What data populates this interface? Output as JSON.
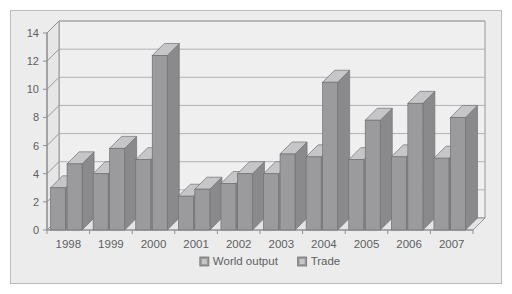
{
  "chart_data": {
    "type": "bar",
    "title": "",
    "subtitle": "",
    "xlabel": "",
    "ylabel": "",
    "categories": [
      "1998",
      "1999",
      "2000",
      "2001",
      "2002",
      "2003",
      "2004",
      "2005",
      "2006",
      "2007"
    ],
    "series": [
      {
        "name": "World output",
        "color": "#9b9b9d",
        "values": [
          3.0,
          4.0,
          5.0,
          2.4,
          3.3,
          4.0,
          5.2,
          5.0,
          5.2,
          5.1
        ]
      },
      {
        "name": "Trade",
        "color": "#9b9b9d",
        "values": [
          4.7,
          5.8,
          12.4,
          2.9,
          4.0,
          5.4,
          10.5,
          7.8,
          9.0,
          8.0
        ]
      }
    ],
    "ylim": [
      0,
      14
    ],
    "yticks": [
      0,
      2,
      4,
      6,
      8,
      10,
      12,
      14
    ],
    "ytick_labels": [
      "0",
      "2",
      "4",
      "6",
      "8",
      "10",
      "12",
      "14"
    ],
    "grid": true,
    "grid_axis": "y",
    "legend_position": "bottom",
    "style": "3d-bar",
    "colors": {
      "panel_background": "#ececed",
      "plot_background": "#efeff0",
      "panel_border": "#b9babc",
      "grid_line": "#a9aaac",
      "axis_line": "#8e8f92",
      "bar_front": "#9b9b9d",
      "bar_top": "#c6c6c8",
      "bar_side": "#8a8a8c",
      "bar_outline": "#6f7072",
      "text": "#5d5f62"
    }
  }
}
